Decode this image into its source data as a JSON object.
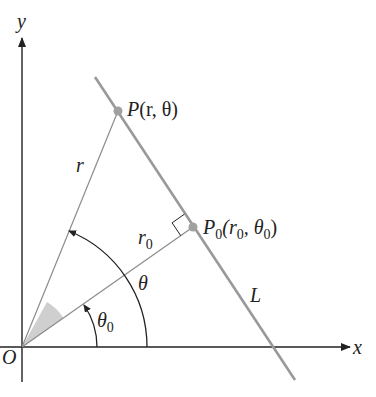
{
  "diagram": {
    "type": "polar-line-geometry",
    "axes": {
      "x_label": "x",
      "y_label": "y",
      "origin_label": "O"
    },
    "line_label": "L",
    "points": {
      "P": {
        "name": "P",
        "args": "(r, θ)"
      },
      "P0": {
        "name": "P",
        "sub": "0",
        "args_open": "(r",
        "args_sub1": "0",
        "args_mid": ", θ",
        "args_sub2": "0",
        "args_close": ")"
      }
    },
    "segment_labels": {
      "r": "r",
      "r0_main": "r",
      "r0_sub": "0"
    },
    "angle_labels": {
      "theta": "θ",
      "theta0_main": "θ",
      "theta0_sub": "0"
    },
    "colors": {
      "axis": "#222222",
      "line_L": "#999999",
      "ray": "#8c8c8c",
      "point": "#a0a0a0",
      "shade": "#cfcfcf",
      "arc": "#222222"
    }
  }
}
